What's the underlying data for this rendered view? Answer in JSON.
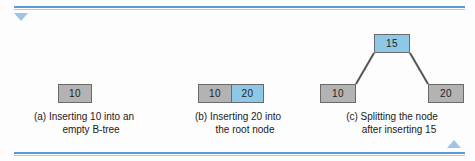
{
  "figure": {
    "nav": {
      "prev_icon": "triangle-down-icon",
      "next_icon": "triangle-up-icon"
    },
    "panels": [
      {
        "id": "a",
        "caption_line1": "(a) Inserting 10 into an",
        "caption_line2": "empty B-tree",
        "nodes": [
          {
            "name": "root-node",
            "keys": [
              {
                "value": "10",
                "highlight": false
              }
            ]
          }
        ]
      },
      {
        "id": "b",
        "caption_line1": "(b) Inserting 20 into",
        "caption_line2": "the root node",
        "nodes": [
          {
            "name": "root-node",
            "keys": [
              {
                "value": "10",
                "highlight": false
              },
              {
                "value": "20",
                "highlight": true
              }
            ]
          }
        ]
      },
      {
        "id": "c",
        "caption_line1": "(c) Splitting the node",
        "caption_line2": "after inserting 15",
        "nodes": [
          {
            "name": "root-node",
            "keys": [
              {
                "value": "15",
                "highlight": true
              }
            ]
          },
          {
            "name": "left-child-node",
            "keys": [
              {
                "value": "10",
                "highlight": false
              }
            ]
          },
          {
            "name": "right-child-node",
            "keys": [
              {
                "value": "20",
                "highlight": false
              }
            ]
          }
        ]
      }
    ],
    "colors": {
      "highlight_fill": "#8ec8e6",
      "node_fill": "#b3b3b3",
      "node_border": "#6a6a6a",
      "rule": "#5b9bd5",
      "edge": "#555555"
    }
  }
}
